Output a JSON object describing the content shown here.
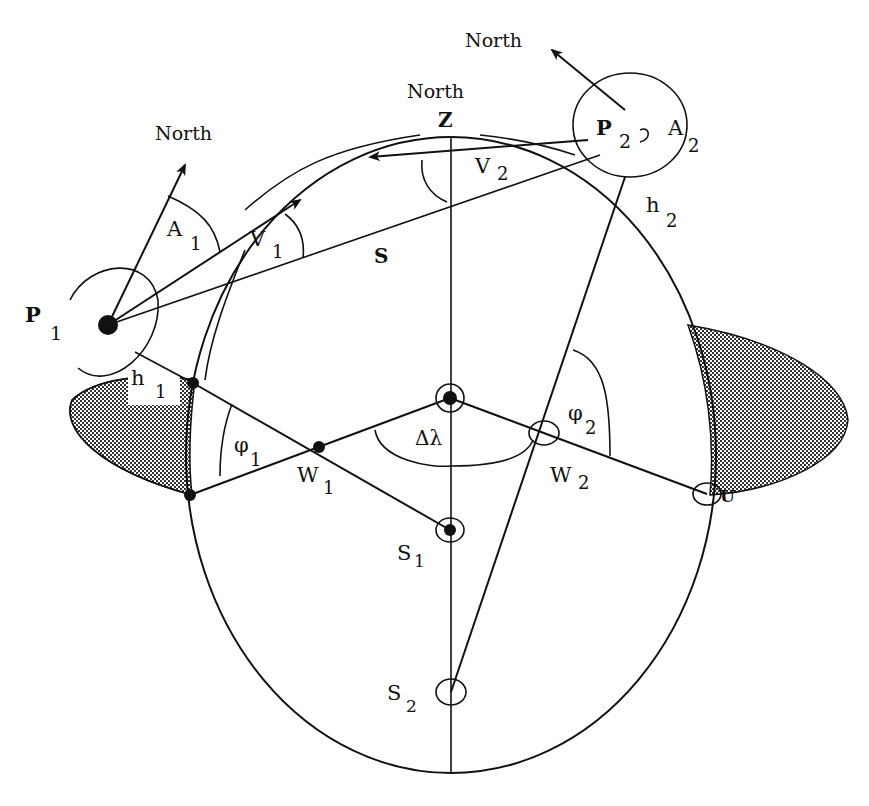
{
  "diagram": {
    "type": "geometry / sun-path projection diagram",
    "colors": {
      "ink": "#111111",
      "background": "#ffffff",
      "hatch": "#555555"
    },
    "labels": {
      "north_p1": "North",
      "north_z": "North",
      "north_p2": "North",
      "z": "Z",
      "p1": "P",
      "p1_sub": "1",
      "p2": "P",
      "p2_sub": "2",
      "a1": "A",
      "a1_sub": "1",
      "a2": "A",
      "a2_sub": "2",
      "v1": "V",
      "v1_sub": "1",
      "v2": "V",
      "v2_sub": "2",
      "s": "S",
      "h1": "h",
      "h1_sub": "1",
      "h2": "h",
      "h2_sub": "2",
      "phi1": "φ",
      "phi1_sub": "1",
      "phi2": "φ",
      "phi2_sub": "2",
      "w1": "W",
      "w1_sub": "1",
      "w2": "W",
      "w2_sub": "2",
      "delta_lambda": "Δλ",
      "s1": "S",
      "s1_sub": "1",
      "s2": "S",
      "s2_sub": "2",
      "u": "U"
    }
  }
}
